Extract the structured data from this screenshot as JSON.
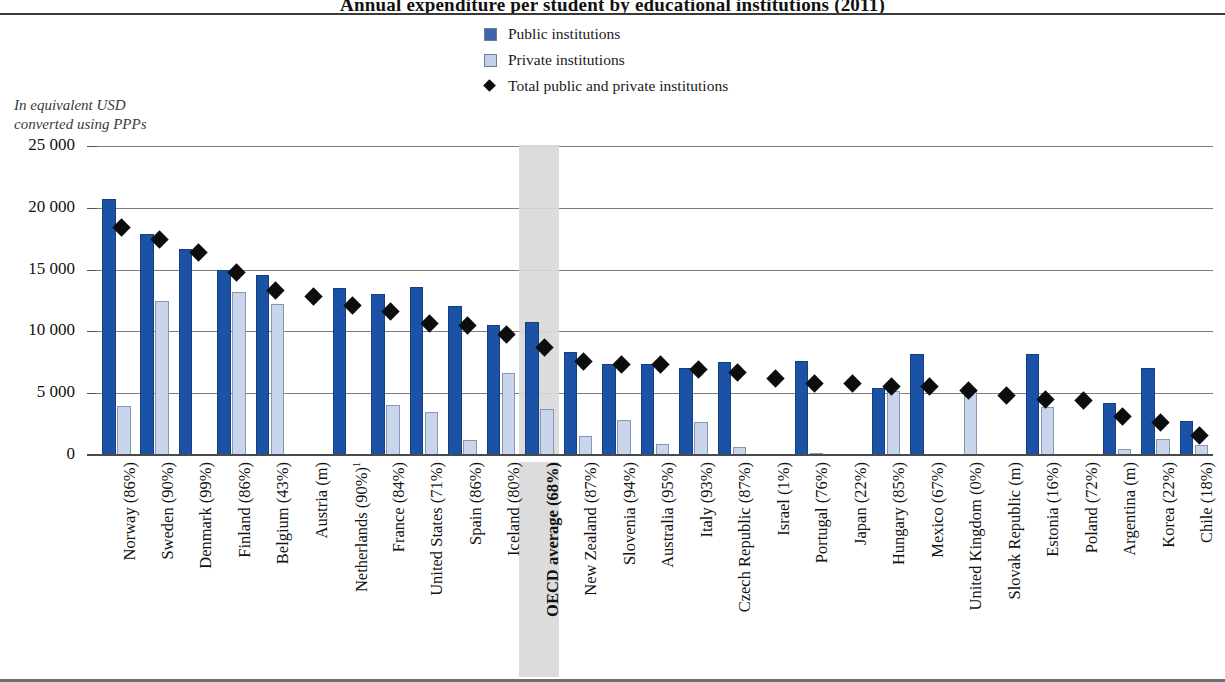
{
  "figure": {
    "title_partial": "Annual expenditure per student by educational institutions (2011)",
    "axis_note_line1": "In equivalent USD",
    "axis_note_line2": "converted using PPPs"
  },
  "legend": {
    "items": [
      {
        "key": "public",
        "label": "Public institutions",
        "color": "#3f63ad",
        "marker": "square"
      },
      {
        "key": "private",
        "label": "Private institutions",
        "color": "#c2d0e7",
        "marker": "square"
      },
      {
        "key": "total",
        "label": "Total public and private institutions",
        "color": "#0d0d0d",
        "marker": "diamond"
      }
    ]
  },
  "chart_data": {
    "type": "bar",
    "title": "Annual expenditure per student by educational institutions (2011)",
    "xlabel": "",
    "ylabel": "In equivalent USD converted using PPPs",
    "ylim": [
      0,
      25000
    ],
    "yticks": [
      0,
      5000,
      10000,
      15000,
      20000,
      25000
    ],
    "ytick_labels": [
      "0",
      "5 000",
      "10 000",
      "15 000",
      "20 000",
      "25 000"
    ],
    "grid": true,
    "legend_position": "top-center",
    "highlight_category": "OECD average (68%)",
    "categories": [
      "Norway (86%)",
      "Sweden (90%)",
      "Denmark (99%)",
      "Finland (86%)",
      "Belgium (43%)",
      "Austria (m)",
      "Netherlands (90%)¹",
      "France (84%)",
      "United States (71%)",
      "Spain (86%)",
      "Iceland (80%)",
      "OECD average (68%)",
      "New Zealand (87%)",
      "Slovenia (94%)",
      "Australia (95%)",
      "Italy (93%)",
      "Czech Republic (87%)",
      "Israel (1%)",
      "Portugal (76%)",
      "Japan (22%)",
      "Hungary (85%)",
      "Mexico (67%)",
      "United Kingdom (0%)",
      "Slovak Republic (m)",
      "Estonia (16%)",
      "Poland (72%)",
      "Argentina (m)",
      "Korea (22%)",
      "Chile (18%)"
    ],
    "series": [
      {
        "name": "Public institutions",
        "color": "#1b52a6",
        "values": [
          20700,
          17850,
          16650,
          14950,
          14550,
          null,
          13500,
          13050,
          13600,
          12050,
          10500,
          10750,
          8350,
          7350,
          7400,
          7000,
          7550,
          null,
          7600,
          null,
          5400,
          8150,
          null,
          null,
          8150,
          null,
          4200,
          7050,
          2750
        ]
      },
      {
        "name": "Private institutions",
        "color": "#c8d5ea",
        "values": [
          3950,
          12500,
          null,
          13150,
          12250,
          null,
          null,
          4050,
          3500,
          1200,
          6600,
          3700,
          1550,
          2800,
          900,
          2700,
          650,
          null,
          200,
          null,
          5150,
          null,
          5250,
          null,
          3850,
          null,
          500,
          1300,
          800
        ]
      }
    ],
    "markers": {
      "name": "Total public and private institutions",
      "color": "#0d0d0d",
      "values": [
        18400,
        17400,
        16400,
        14750,
        13300,
        12800,
        12100,
        11600,
        10650,
        10500,
        9750,
        8700,
        7600,
        7350,
        7300,
        6900,
        6700,
        6150,
        5750,
        5800,
        5550,
        5550,
        5250,
        4850,
        4500,
        4400,
        3150,
        2600,
        1600
      ]
    }
  }
}
